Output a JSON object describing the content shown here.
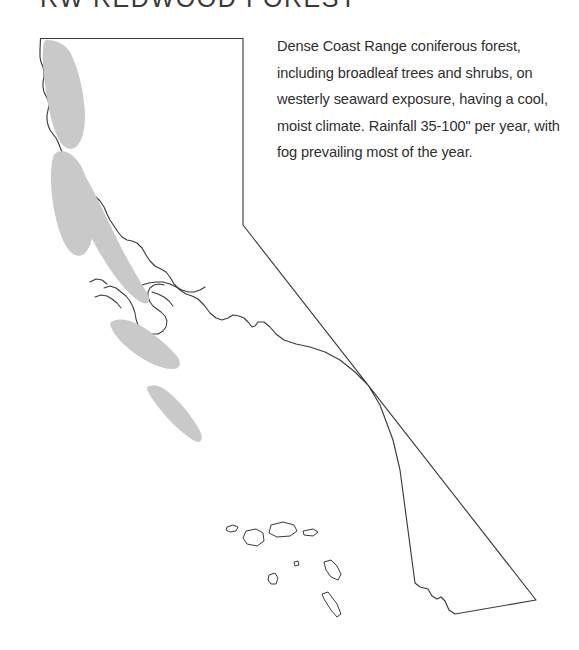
{
  "page": {
    "width": 579,
    "height": 650,
    "background_color": "#ffffff"
  },
  "title": {
    "code": "RW",
    "name": "REDWOOD FOREST",
    "full_text": "RW REDWOOD FOREST",
    "color": "#3a3a3a"
  },
  "legend": {
    "description": "Dense Coast Range coniferous forest, including broadleaf trees and shrubs, on westerly seaward exposure, having a cool, moist climate. Rainfall 35-100\" per year, with fog prevailing most of the year.",
    "text_color": "#2f2f2f"
  },
  "map": {
    "region_name": "California",
    "outline_color": "#3b3b3b",
    "fill_color": "#ffffff",
    "forest_fill_color": "#c9c9c9",
    "forest_region_count": 5,
    "forest_regions": [
      "north-coast-del-norte-humboldt",
      "north-coast-humboldt-south",
      "mendocino-coast",
      "sonoma-marin-coast",
      "santa-cruz-big-sur-coast"
    ],
    "island_count": 8,
    "islands": [
      "san-miguel",
      "santa-rosa",
      "santa-cruz-island",
      "anacapa",
      "santa-barbara-island",
      "santa-catalina",
      "san-nicolas",
      "san-clemente"
    ]
  }
}
